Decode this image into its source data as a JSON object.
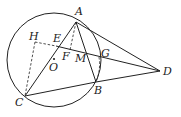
{
  "diagram": {
    "type": "geometry",
    "circle": {
      "center_label": "O",
      "cx": 54,
      "cy": 60,
      "r": 47
    },
    "points": {
      "A": {
        "label": "A",
        "x": 76,
        "y": 22
      },
      "B": {
        "label": "B",
        "x": 96,
        "y": 82
      },
      "C": {
        "label": "C",
        "x": 25,
        "y": 96
      },
      "D": {
        "label": "D",
        "x": 160,
        "y": 71
      },
      "E": {
        "label": "E",
        "x": 57,
        "y": 47
      },
      "F": {
        "label": "F",
        "x": 70,
        "y": 50
      },
      "G": {
        "label": "G",
        "x": 99,
        "y": 57
      },
      "H": {
        "label": "H",
        "x": 35,
        "y": 42
      },
      "M": {
        "label": "M",
        "x": 86,
        "y": 54
      },
      "O": {
        "label": "O",
        "x": 54,
        "y": 63
      }
    },
    "segments_solid": [
      "AC",
      "AB",
      "AD",
      "CB",
      "BD",
      "ED"
    ],
    "segments_dashed": [
      "HC",
      "HE",
      "AF",
      "GB"
    ]
  }
}
